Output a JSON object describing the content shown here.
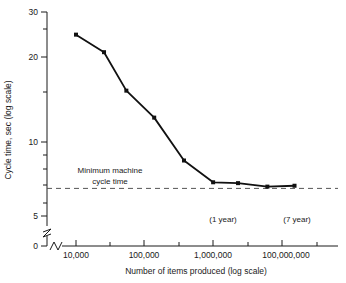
{
  "chart_data": {
    "type": "line",
    "title": "",
    "xlabel": "Number of items produced (log scale)",
    "ylabel": "Cycle time, sec (log scale)",
    "x_scale": "log",
    "y_scale": "log",
    "grid": false,
    "legend": "none",
    "xlim": [
      4000,
      400000000
    ],
    "ylim": [
      4.6,
      31
    ],
    "x_tick_labels": [
      "10,000",
      "100,000",
      "1,000,000",
      "100,000,000"
    ],
    "x_tick_values": [
      10000,
      100000,
      1000000,
      100000000
    ],
    "y_tick_labels": [
      "30",
      "20",
      "10",
      "5",
      "0"
    ],
    "y_tick_values": [
      30,
      20,
      10,
      5,
      0
    ],
    "y_axis_break": true,
    "x_axis_break": true,
    "series": [
      {
        "name": "Cycle time",
        "x": [
          10000,
          35000,
          95000,
          330000,
          1250000,
          4600000,
          14000000,
          52000000,
          175000000
        ],
        "y": [
          24.0,
          20.8,
          15.2,
          12.2,
          8.6,
          7.2,
          7.15,
          6.95,
          7.0
        ]
      }
    ],
    "reference_line": {
      "y": 6.85,
      "style": "dashed",
      "label_line1": "Minimum machine",
      "label_line2": "cycle time"
    },
    "annotations": [
      {
        "text": "(1 year)",
        "x": 1100000,
        "y": 5.35
      },
      {
        "text": "(7 year)",
        "x": 60000000,
        "y": 5.35
      }
    ]
  },
  "labels": {
    "y_axis_title": "Cycle time, sec (log scale)",
    "x_axis_title": "Number of items produced (log scale)",
    "y_30": "30",
    "y_20": "20",
    "y_10": "10",
    "y_5": "5",
    "y_0": "0",
    "x_10k": "10,000",
    "x_100k": "100,000",
    "x_1m": "1,000,000",
    "x_100m": "100,000,000",
    "ref_label_1": "Minimum machine",
    "ref_label_2": "cycle time",
    "annot_1year": "(1 year)",
    "annot_7year": "(7 year)"
  },
  "colors": {
    "line": "#111111",
    "marker": "#111111",
    "axis": "#1a1a1a",
    "reference": "#555555",
    "background": "#ffffff"
  }
}
